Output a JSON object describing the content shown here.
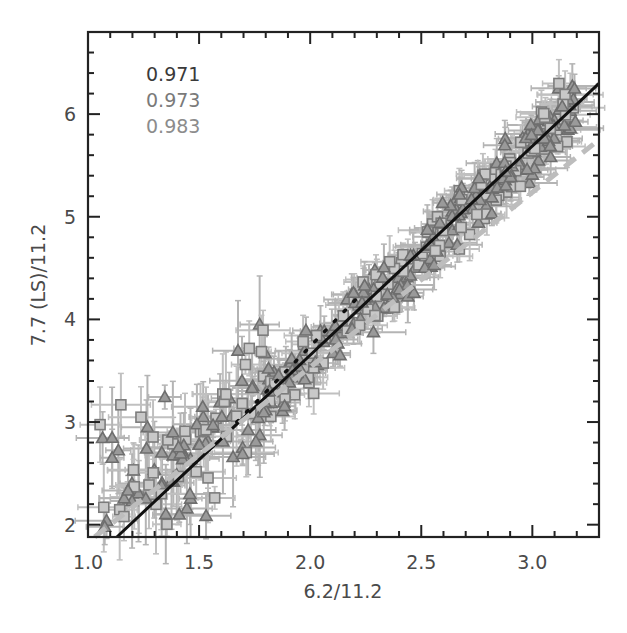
{
  "chart_data": {
    "type": "scatter",
    "title": "",
    "xlabel": "6.2/11.2",
    "ylabel": "7.7 (LS)/11.2",
    "xlim": [
      1.0,
      3.3
    ],
    "ylim": [
      1.88,
      6.8
    ],
    "x_ticks": [
      1.0,
      1.5,
      2.0,
      2.5,
      3.0
    ],
    "x_tick_labels": [
      "1.0",
      "1.5",
      "2.0",
      "2.5",
      "3.0"
    ],
    "y_ticks": [
      2,
      3,
      4,
      5,
      6
    ],
    "y_tick_labels": [
      "2",
      "3",
      "4",
      "5",
      "6"
    ],
    "x_minor_step": 0.1,
    "y_minor_step": 0.2,
    "grid": false,
    "annotations": [
      {
        "text": "0.971",
        "color": "#3a3a3a"
      },
      {
        "text": "0.973",
        "color": "#7a7a7a"
      },
      {
        "text": "0.983",
        "color": "#8c8c8c"
      }
    ],
    "series": [
      {
        "name": "triangles",
        "marker": "triangle",
        "color": "#6e6e6e",
        "errorbar_color": "#b4b4b4"
      },
      {
        "name": "squares",
        "marker": "square",
        "color": "#7c7c7c",
        "errorbar_color": "#c0c0c0"
      }
    ],
    "fit_lines": [
      {
        "name": "solid-fit",
        "style": "solid",
        "color": "#111111",
        "x": [
          1.13,
          3.3
        ],
        "y": [
          1.88,
          6.3
        ]
      },
      {
        "name": "dotted-fit",
        "style": "dotted",
        "color": "#111111",
        "x": [
          1.67,
          2.23
        ],
        "y": [
          3.0,
          4.25
        ]
      },
      {
        "name": "dashed-fit",
        "style": "dashed",
        "color": "#bdbdbd",
        "x": [
          1.03,
          3.3
        ],
        "y": [
          1.88,
          5.75
        ]
      }
    ],
    "cloud": {
      "description": "Dense cloud of points with x/y error bars following y ≈ 2.03x - 0.41, with a broader upper-left wing at x < 1.8",
      "n_points": 430,
      "x_range": [
        1.0,
        3.25
      ],
      "trend_slope": 2.03,
      "trend_intercept": -0.41
    }
  }
}
